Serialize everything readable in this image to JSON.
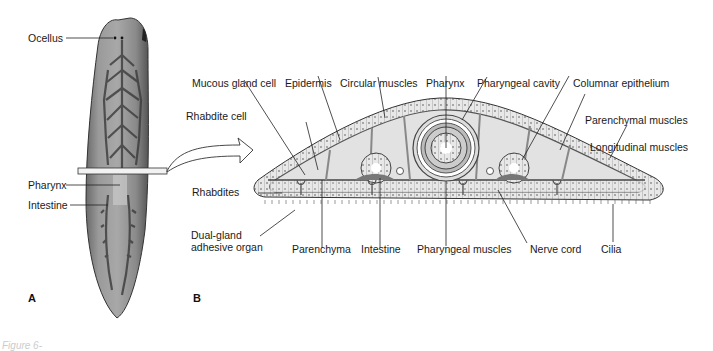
{
  "figure": {
    "panel_a": {
      "letter": "A",
      "subject": "planarian-whole-body",
      "labels": {
        "ocellus": "Ocellus",
        "pharynx": "Pharynx",
        "intestine": "Intestine"
      }
    },
    "panel_b": {
      "letter": "B",
      "subject": "planarian-cross-section",
      "labels": {
        "mucous_gland_cell": "Mucous gland cell",
        "epidermis": "Epidermis",
        "circular_muscles": "Circular muscles",
        "pharynx": "Pharynx",
        "pharyngeal_cavity": "Pharyngeal cavity",
        "columnar_epithelium": "Columnar epithelium",
        "rhabdite_cell": "Rhabdite cell",
        "parenchymal_muscles": "Parenchymal muscles",
        "longitudinal_muscles": "Longitudinal muscles",
        "rhabdites": "Rhabdites",
        "dual_gland": "Dual-gland",
        "adhesive_organ": "adhesive organ",
        "parenchyma": "Parenchyma",
        "intestine": "Intestine",
        "pharyngeal_muscles": "Pharyngeal muscles",
        "nerve_cord": "Nerve cord",
        "cilia": "Cilia"
      }
    },
    "caption_fragment": "Figure 6-"
  }
}
